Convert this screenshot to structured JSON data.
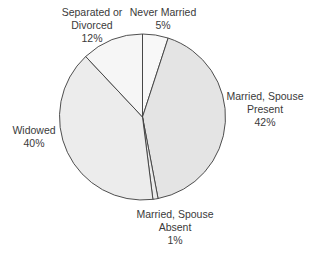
{
  "chart_data": {
    "type": "pie",
    "title": "",
    "categories": [
      "Never Married",
      "Married, Spouse Present",
      "Married, Spouse Absent",
      "Widowed",
      "Separated or Divorced"
    ],
    "values": [
      5,
      42,
      1,
      40,
      12
    ],
    "unit": "%",
    "colors": [
      "#f8f8f8",
      "#e4e4e4",
      "#ebebeb",
      "#ececec",
      "#f6f6f6"
    ],
    "start_angle_deg": 0,
    "direction": "clockwise",
    "legend": "none (direct labels)"
  },
  "labels": {
    "never_married": {
      "line1": "Never Married",
      "line2": "5%"
    },
    "married_present": {
      "line1": "Married, Spouse",
      "line2": "Present",
      "line3": "42%"
    },
    "married_absent": {
      "line1": "Married, Spouse",
      "line2": "Absent",
      "line3": "1%"
    },
    "widowed": {
      "line1": "Widowed",
      "line2": "40%"
    },
    "separated": {
      "line1": "Separated or",
      "line2": "Divorced",
      "line3": "12%"
    }
  }
}
